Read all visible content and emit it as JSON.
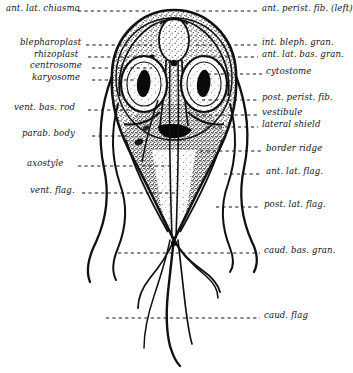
{
  "figure": {
    "ink_color": "#111111",
    "background_color": "#ffffff",
    "stipple_color": "#3a3a3a"
  },
  "labels_left": [
    {
      "text": "ant. lat. chiasma",
      "name": "label-ant-lat-chiasma",
      "x": 6,
      "y": 8,
      "leader_to_x": 148,
      "leader_from_x": 78
    },
    {
      "text": "blepharoplast",
      "name": "label-blepharoplast",
      "x": 20,
      "y": 42,
      "leader_to_x": 150,
      "leader_from_x": 86
    },
    {
      "text": "rhizoplast",
      "name": "label-rhizoplast",
      "x": 34,
      "y": 54,
      "leader_to_x": 152,
      "leader_from_x": 88
    },
    {
      "text": "centrosome",
      "name": "label-centrosome",
      "x": 30,
      "y": 65,
      "leader_to_x": 152,
      "leader_from_x": 92
    },
    {
      "text": "karyosome",
      "name": "label-karyosome",
      "x": 32,
      "y": 77,
      "leader_to_x": 150,
      "leader_from_x": 92
    },
    {
      "text": "vent. bas. rod",
      "name": "label-vent-bas-rod",
      "x": 14,
      "y": 107,
      "leader_to_x": 128,
      "leader_from_x": 88
    },
    {
      "text": "parab. body",
      "name": "label-parab-body",
      "x": 22,
      "y": 133,
      "leader_to_x": 126,
      "leader_from_x": 92
    },
    {
      "text": "axostyle",
      "name": "label-axostyle",
      "x": 27,
      "y": 163,
      "leader_to_x": 160,
      "leader_from_x": 78
    },
    {
      "text": "vent. flag.",
      "name": "label-vent-flag",
      "x": 30,
      "y": 190,
      "leader_to_x": 168,
      "leader_from_x": 82
    }
  ],
  "labels_right": [
    {
      "text": "ant. perist. fib. (left)",
      "name": "label-ant-perist-fib-left",
      "x": 262,
      "y": 8,
      "leader_from_x": 196,
      "leader_to_x": 258
    },
    {
      "text": "int. bleph. gran.",
      "name": "label-int-bleph-gran",
      "x": 262,
      "y": 42,
      "leader_from_x": 196,
      "leader_to_x": 258
    },
    {
      "text": "ant. lat. bas. gran.",
      "name": "label-ant-lat-bas-gran",
      "x": 262,
      "y": 54,
      "leader_from_x": 206,
      "leader_to_x": 258
    },
    {
      "text": "cytostome",
      "name": "label-cytostome",
      "x": 266,
      "y": 71,
      "leader_from_x": 208,
      "leader_to_x": 262
    },
    {
      "text": "post. perist. fib.",
      "name": "label-post-perist-fib",
      "x": 262,
      "y": 97,
      "leader_from_x": 202,
      "leader_to_x": 258
    },
    {
      "text": "vestibule",
      "name": "label-vestibule",
      "x": 262,
      "y": 112,
      "leader_from_x": 196,
      "leader_to_x": 258
    },
    {
      "text": "lateral shield",
      "name": "label-lateral-shield",
      "x": 262,
      "y": 124,
      "leader_from_x": 206,
      "leader_to_x": 258
    },
    {
      "text": "border ridge",
      "name": "label-border-ridge",
      "x": 266,
      "y": 148,
      "leader_from_x": 200,
      "leader_to_x": 262
    },
    {
      "text": "ant. lat. flag.",
      "name": "label-ant-lat-flag",
      "x": 266,
      "y": 171,
      "leader_from_x": 222,
      "leader_to_x": 262
    },
    {
      "text": "post. lat. flag.",
      "name": "label-post-lat-flag",
      "x": 264,
      "y": 204,
      "leader_from_x": 214,
      "leader_to_x": 260
    },
    {
      "text": "caud. bas. gran.",
      "name": "label-caud-bas-gran",
      "x": 264,
      "y": 250,
      "leader_from_x": 118,
      "leader_to_x": 260
    },
    {
      "text": "caud. flag",
      "name": "label-caud-flag",
      "x": 264,
      "y": 315,
      "leader_from_x": 106,
      "leader_to_x": 260
    }
  ]
}
